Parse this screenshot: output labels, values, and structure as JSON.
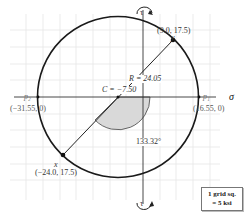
{
  "diagram": {
    "type": "mohrs-circle",
    "axes": {
      "horizontal_label": "σ",
      "vertical_label_top": "τ",
      "vertical_label_bottom": "τ"
    },
    "center": {
      "label": "C = −7.50",
      "value": -7.5
    },
    "radius": {
      "label": "R = 24.05",
      "value": 24.05
    },
    "points": {
      "y": {
        "name": "y",
        "coords": "(9.0, 17.5)"
      },
      "x": {
        "name": "x",
        "coords": "(−24.0, 17.5)"
      },
      "p1": {
        "name": "p₁",
        "coords": "(16.55, 0)"
      },
      "p2": {
        "name": "p₂",
        "coords": "(−31.55, 0)"
      }
    },
    "angle": {
      "label": "133.32°",
      "value": 133.32
    },
    "legend": {
      "line1": "1 grid sq.",
      "line2": "= 5 ksi"
    },
    "colors": {
      "circle": "#1a1a1a",
      "grid": "#e6e6e6",
      "axis": "#333333",
      "angle_fill": "#d9d9d9"
    }
  }
}
